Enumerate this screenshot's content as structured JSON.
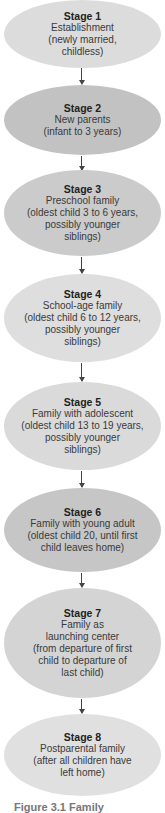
{
  "diagram": {
    "type": "vertical-flowchart",
    "stages": [
      {
        "title": "Stage 1",
        "description": "Establishment\n(newly married,\nchildless)",
        "fill": "#dcdcdc"
      },
      {
        "title": "Stage 2",
        "description": "New parents\n(infant to 3 years)",
        "fill": "#c2c2c2"
      },
      {
        "title": "Stage 3",
        "description": "Preschool family\n(oldest child 3 to 6 years,\npossibly younger\nsiblings)",
        "fill": "#cbcbcb"
      },
      {
        "title": "Stage 4",
        "description": "School-age family\n(oldest child 6 to 12 years,\npossibly younger\nsiblings)",
        "fill": "#dedede"
      },
      {
        "title": "Stage 5",
        "description": "Family with adolescent\n(oldest child 13 to 19 years,\npossibly younger\nsiblings)",
        "fill": "#dadada"
      },
      {
        "title": "Stage 6",
        "description": "Family with young adult\n(oldest child 20, until first\nchild leaves home)",
        "fill": "#c6c6c6"
      },
      {
        "title": "Stage 7",
        "description": "Family as\nlaunching center\n(from departure of first\nchild to departure of\nlast child)",
        "fill": "#d4d4d4"
      },
      {
        "title": "Stage 8",
        "description": "Postparental family\n(after all children have\nleft home)",
        "fill": "#e0e0e0"
      }
    ],
    "arrow_color": "#444444",
    "caption": "Figure 3.1  Family"
  }
}
